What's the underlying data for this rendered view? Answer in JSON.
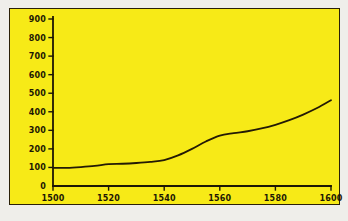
{
  "figure": {
    "background_color": "#f7ea17",
    "border_color": "#2a2008",
    "outer_margin_color": "#efeeea",
    "line_color": "#231a05",
    "axis_color": "#1d1704"
  },
  "chart_data": {
    "type": "line",
    "title": "",
    "subtitle": "",
    "xlabel": "",
    "ylabel": "",
    "xlim": [
      1500,
      1600
    ],
    "ylim": [
      0,
      900
    ],
    "grid": false,
    "legend": false,
    "legend_position": "none",
    "x_ticks": [
      1500,
      1520,
      1540,
      1560,
      1580,
      1600
    ],
    "x_tick_labels": [
      "1500",
      "1520",
      "1540",
      "1560",
      "1580",
      "1600"
    ],
    "y_ticks": [
      0,
      100,
      200,
      300,
      400,
      500,
      600,
      700,
      800,
      900
    ],
    "y_tick_labels": [
      "0",
      "100",
      "200",
      "300",
      "400",
      "500",
      "600",
      "700",
      "800",
      "900"
    ],
    "series": [
      {
        "name": "",
        "x": [
          1500,
          1505,
          1510,
          1515,
          1520,
          1525,
          1530,
          1535,
          1540,
          1545,
          1550,
          1555,
          1560,
          1565,
          1570,
          1575,
          1580,
          1585,
          1590,
          1595,
          1600
        ],
        "values": [
          98,
          98,
          102,
          108,
          118,
          120,
          124,
          130,
          140,
          165,
          200,
          240,
          272,
          285,
          295,
          310,
          330,
          355,
          385,
          420,
          462
        ]
      }
    ]
  }
}
